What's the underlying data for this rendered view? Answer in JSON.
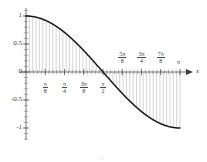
{
  "figure": {
    "kind": "function-plot",
    "background": "#ffffff",
    "curve_color": "#1a1a1a",
    "axis_color": "#555555",
    "hatch_color": "#b9b9b9"
  },
  "axes": {
    "x_axis_label": "x",
    "y_tick_labels": [
      "1",
      "0.5",
      "0",
      "-0.5",
      "-1"
    ],
    "y_tick_values": [
      1,
      0.5,
      0,
      -0.5,
      -1
    ],
    "x_ticks_below": [
      {
        "num": "π",
        "den": "8",
        "value": 0.125
      },
      {
        "num": "π",
        "den": "4",
        "value": 0.25
      },
      {
        "num": "3π",
        "den": "8",
        "value": 0.375
      },
      {
        "num": "π",
        "den": "2",
        "value": 0.5
      }
    ],
    "x_ticks_above": [
      {
        "num": "5π",
        "den": "8",
        "value": 0.625
      },
      {
        "num": "3π",
        "den": "4",
        "value": 0.75
      },
      {
        "num": "7π",
        "den": "8",
        "value": 0.875
      }
    ],
    "x_end_label": "π",
    "x_end_value": 1.0
  },
  "caption": "π",
  "chart_data": {
    "type": "line",
    "title": "",
    "xlabel": "x",
    "ylabel": "",
    "grid": false,
    "legend": null,
    "xlim": [
      0,
      1.0
    ],
    "ylim": [
      -1,
      1
    ],
    "x_unit": "π radians",
    "function": "y = cos(x)",
    "fill": "vertical hatch lines between curve and x-axis over [0, π]",
    "x": [
      0,
      0.0625,
      0.125,
      0.1875,
      0.25,
      0.3125,
      0.375,
      0.4375,
      0.5,
      0.5625,
      0.625,
      0.6875,
      0.75,
      0.8125,
      0.875,
      0.9375,
      1.0
    ],
    "values": [
      1.0,
      0.981,
      0.924,
      0.831,
      0.707,
      0.556,
      0.383,
      0.195,
      0.0,
      -0.195,
      -0.383,
      -0.556,
      -0.707,
      -0.831,
      -0.924,
      -0.981,
      -1.0
    ]
  }
}
